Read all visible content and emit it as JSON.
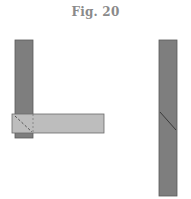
{
  "figure": {
    "title": "Fig. 20",
    "colors": {
      "dark_piece": "#7e7e7e",
      "light_piece": "#bdbdbd",
      "outline": "#5a5a5a",
      "joint_line": "#3a3a3a"
    },
    "parts": [
      {
        "name": "left-vertical-member",
        "description": "vertical piece of corner joint"
      },
      {
        "name": "horizontal-member",
        "description": "horizontal piece overlapping vertical piece"
      },
      {
        "name": "right-vertical-member",
        "description": "single vertical piece with diagonal scarf joint"
      }
    ]
  }
}
